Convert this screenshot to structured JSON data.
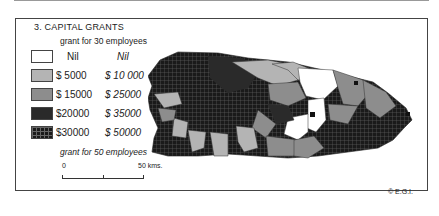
{
  "map": {
    "title": "3. CAPITAL GRANTS",
    "legend_header_top": "grant for 30 employees",
    "legend_header_bottom": "grant for 50 employees",
    "legend": [
      {
        "swatch": "white",
        "grant_30": "Nil",
        "grant_50": "Nil"
      },
      {
        "swatch": "light-grey",
        "grant_30": "$ 5000",
        "grant_50": "$ 10 000"
      },
      {
        "swatch": "mid-grey",
        "grant_30": "$ 15000",
        "grant_50": "$ 25000"
      },
      {
        "swatch": "dark",
        "grant_30": "$20000",
        "grant_50": "$ 35000"
      },
      {
        "swatch": "dark-hatched",
        "grant_30": "$30000",
        "grant_50": "$ 50000"
      }
    ],
    "scale": {
      "start": "0",
      "end": "50 kms."
    },
    "credit": "© E.G.I."
  }
}
